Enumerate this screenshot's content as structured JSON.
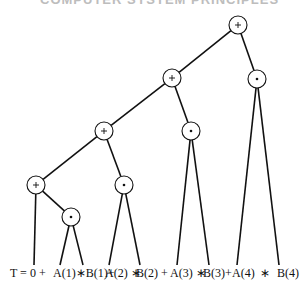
{
  "header": {
    "text": "COMPUTER SYSTEM PRINCIPLES"
  },
  "colors": {
    "line": "#111111",
    "background": "#ffffff",
    "header": "#bdbdbd"
  },
  "tree": {
    "nodes": [
      {
        "id": "n1",
        "op": "+",
        "x": 238,
        "y": 25
      },
      {
        "id": "n2",
        "op": "+",
        "x": 172,
        "y": 78
      },
      {
        "id": "n3",
        "op": "*",
        "x": 257,
        "y": 79
      },
      {
        "id": "n4",
        "op": "+",
        "x": 104,
        "y": 131
      },
      {
        "id": "n5",
        "op": "*",
        "x": 191,
        "y": 131
      },
      {
        "id": "n6",
        "op": "+",
        "x": 36,
        "y": 185
      },
      {
        "id": "n7",
        "op": "*",
        "x": 124,
        "y": 185
      },
      {
        "id": "n8",
        "op": "*",
        "x": 71,
        "y": 217
      }
    ],
    "edges": [
      [
        "n1",
        "n2"
      ],
      [
        "n1",
        "n3"
      ],
      [
        "n2",
        "n4"
      ],
      [
        "n2",
        "n5"
      ],
      [
        "n4",
        "n6"
      ],
      [
        "n4",
        "n7"
      ],
      [
        "n6",
        "n8"
      ],
      [
        "n6",
        "L0"
      ],
      [
        "n8",
        "L1"
      ],
      [
        "n8",
        "L2"
      ],
      [
        "n7",
        "L3"
      ],
      [
        "n7",
        "L4"
      ],
      [
        "n5",
        "L5"
      ],
      [
        "n5",
        "L6"
      ],
      [
        "n3",
        "L7"
      ],
      [
        "n3",
        "L8"
      ]
    ],
    "leaves": [
      {
        "id": "L0",
        "x": 34,
        "y": 265
      },
      {
        "id": "L1",
        "x": 60,
        "y": 265
      },
      {
        "id": "L2",
        "x": 83,
        "y": 265
      },
      {
        "id": "L3",
        "x": 109,
        "y": 265
      },
      {
        "id": "L4",
        "x": 140,
        "y": 265
      },
      {
        "id": "L5",
        "x": 177,
        "y": 265
      },
      {
        "id": "L6",
        "x": 209,
        "y": 265
      },
      {
        "id": "L7",
        "x": 237,
        "y": 265
      },
      {
        "id": "L8",
        "x": 279,
        "y": 265
      }
    ]
  },
  "expression": {
    "tokens": [
      {
        "text": "T = 0 +",
        "x": 10
      },
      {
        "text": "A(1)∗B(1)+",
        "x": 53
      },
      {
        "text": "A(2) ∗",
        "x": 105
      },
      {
        "text": "B(2) +",
        "x": 136
      },
      {
        "text": "A(3)  ∗",
        "x": 170
      },
      {
        "text": "B(3)+",
        "x": 203
      },
      {
        "text": "A(4)",
        "x": 232
      },
      {
        "text": "∗",
        "x": 260
      },
      {
        "text": "B(4)",
        "x": 277
      }
    ]
  }
}
